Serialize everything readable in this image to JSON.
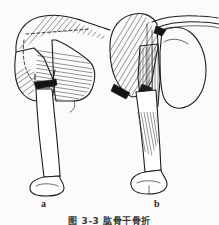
{
  "figure": {
    "caption": "图 3-3  肱骨干骨折",
    "caption_note": "caption row is clipped by the bottom edge of the scan",
    "panels": [
      {
        "id": "a",
        "label": "a",
        "description": "Anterior view of left shoulder and humerus showing a mid/proximal humeral shaft fracture above the deltoid insertion; deltoid shown hatched over the shoulder, pectoralis major fibers hatched medially, fracture gap marked solid black.",
        "parts": [
          "deltoid-muscle",
          "pectoralis-major-muscle",
          "scapula",
          "humeral-head",
          "humeral-shaft",
          "fracture-line",
          "distal-humerus-condyle"
        ]
      },
      {
        "id": "b",
        "label": "b",
        "description": "Anterior view of left shoulder and humerus showing a humeral shaft fracture below the deltoid insertion with the proximal fragment displaced; deltoid hatched, biceps/brachialis strips hatched along the shaft, fracture gap marked solid black.",
        "parts": [
          "deltoid-muscle",
          "biceps-brachii-muscle",
          "brachialis-muscle",
          "clavicle",
          "scapula",
          "humeral-head",
          "humeral-shaft",
          "fracture-line",
          "distal-humerus-condyle"
        ]
      }
    ],
    "colors": {
      "ink": "#1e1e1e",
      "hatch": "#3a3a3a",
      "fracture_fill": "#141414",
      "paper": "#fcfbf9"
    }
  }
}
